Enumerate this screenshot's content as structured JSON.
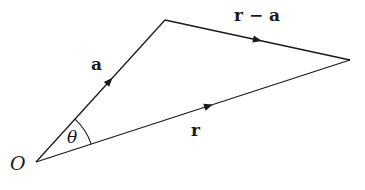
{
  "diagram": {
    "type": "vector-triangle",
    "points": {
      "origin": {
        "label": "O"
      }
    },
    "vectors": [
      {
        "id": "a",
        "label": "a",
        "from": "origin",
        "to": "tip_a"
      },
      {
        "id": "r",
        "label": "r",
        "from": "origin",
        "to": "tip_r"
      },
      {
        "id": "r_minus_a",
        "label": "r − a",
        "from": "tip_a",
        "to": "tip_r"
      }
    ],
    "angle": {
      "label": "θ",
      "between": [
        "a",
        "r"
      ]
    },
    "colors": {
      "ink": "#1a1a1a",
      "background": "#ffffff"
    }
  }
}
